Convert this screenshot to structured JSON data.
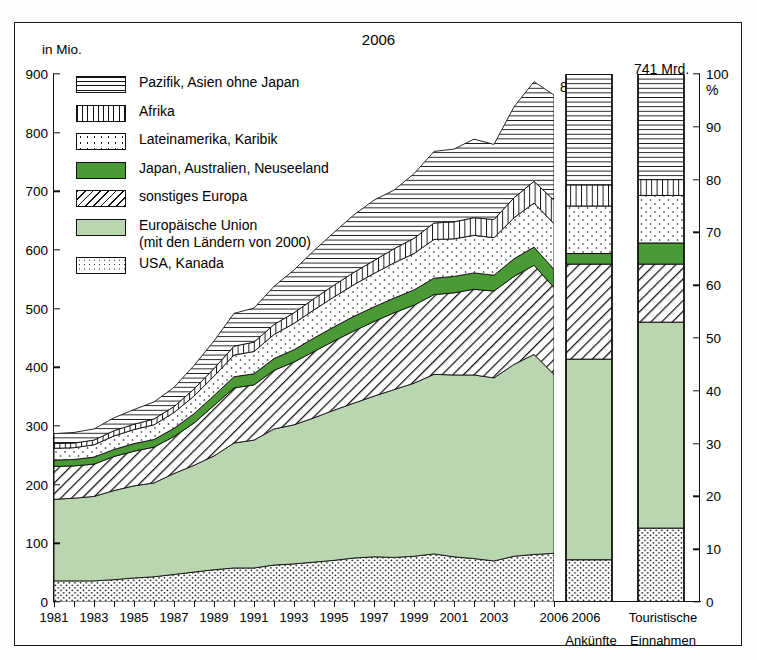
{
  "units": {
    "left_axis": "in Mio.",
    "right_axis": "%"
  },
  "header": {
    "year": "2006",
    "arrivals_value": "864 Mio.",
    "receipts_value_line1": "741 Mrd.",
    "receipts_value_line2": "US-$"
  },
  "colors": {
    "japan_green": "#4b9a36",
    "eu_green": "#bad6b1",
    "ink": "#111111",
    "paper": "#ffffff"
  },
  "legend": {
    "items": [
      {
        "label": "Pazifik, Asien ohne Japan",
        "sub": "",
        "pattern": "horizontal-lines",
        "key": "pazifik"
      },
      {
        "label": "Afrika",
        "sub": "",
        "pattern": "vertical-lines",
        "key": "afrika"
      },
      {
        "label": "Lateinamerika, Karibik",
        "sub": "",
        "pattern": "sparse-dots",
        "key": "latein"
      },
      {
        "label": "Japan, Australien, Neuseeland",
        "sub": "",
        "pattern": "solid-dark-green",
        "key": "japan"
      },
      {
        "label": "sonstiges Europa",
        "sub": "",
        "pattern": "diagonal-hatch",
        "key": "sonstiges"
      },
      {
        "label": "Europäische Union",
        "sub": "(mit den Ländern von 2000)",
        "pattern": "solid-light-green",
        "key": "eu"
      },
      {
        "label": "USA, Kanada",
        "sub": "",
        "pattern": "dense-dots",
        "key": "usa"
      }
    ]
  },
  "bottom_labels": {
    "year_2006": "2006",
    "group_title": "Touristische",
    "bar1": "Ankünfte",
    "bar2": "Einnahmen"
  },
  "chart_data": {
    "type": "area",
    "xlabel": "",
    "ylabel": "in Mio.",
    "ylim": [
      0,
      900
    ],
    "yticks": [
      0,
      100,
      200,
      300,
      400,
      500,
      600,
      700,
      800,
      900
    ],
    "right_ylim": [
      0,
      100
    ],
    "right_yticks": [
      0,
      10,
      20,
      30,
      40,
      50,
      60,
      70,
      80,
      90,
      100
    ],
    "grid": false,
    "legend_position": "upper-left-inside",
    "x": [
      1981,
      1982,
      1983,
      1984,
      1985,
      1986,
      1987,
      1988,
      1989,
      1990,
      1991,
      1992,
      1993,
      1994,
      1995,
      1996,
      1997,
      1998,
      1999,
      2000,
      2001,
      2002,
      2003,
      2004,
      2005,
      2006
    ],
    "xtick_labels": [
      "1981",
      "1983",
      "1985",
      "1987",
      "1989",
      "1991",
      "1993",
      "1995",
      "1997",
      "1999",
      "2001",
      "2003",
      "2006"
    ],
    "stack_order_bottom_to_top": [
      "USA, Kanada",
      "Europäische Union",
      "sonstiges Europa",
      "Japan, Australien, Neuseeland",
      "Lateinamerika, Karibik",
      "Afrika",
      "Pazifik, Asien ohne Japan"
    ],
    "series": [
      {
        "name": "USA, Kanada",
        "values": [
          36,
          36,
          36,
          38,
          41,
          43,
          47,
          51,
          55,
          58,
          58,
          63,
          65,
          68,
          71,
          75,
          77,
          76,
          78,
          82,
          77,
          74,
          70,
          78,
          81,
          83
        ]
      },
      {
        "name": "Europäische Union",
        "values": [
          139,
          141,
          144,
          152,
          157,
          160,
          172,
          182,
          194,
          213,
          218,
          232,
          237,
          246,
          256,
          264,
          274,
          286,
          295,
          306,
          310,
          313,
          312,
          327,
          341,
          305
        ]
      },
      {
        "name": "sonstiges Europa",
        "values": [
          56,
          55,
          55,
          58,
          59,
          61,
          63,
          72,
          86,
          94,
          94,
          100,
          107,
          113,
          118,
          123,
          127,
          131,
          133,
          136,
          140,
          146,
          148,
          150,
          152,
          148
        ]
      },
      {
        "name": "Japan, Australien, Neuseeland",
        "values": [
          11,
          11,
          12,
          12,
          13,
          13,
          14,
          16,
          17,
          19,
          19,
          20,
          21,
          23,
          24,
          25,
          25,
          25,
          26,
          28,
          28,
          28,
          27,
          30,
          31,
          31
        ]
      },
      {
        "name": "Lateinamerika, Karibik",
        "values": [
          20,
          20,
          21,
          23,
          24,
          25,
          27,
          30,
          33,
          37,
          38,
          41,
          45,
          48,
          51,
          54,
          57,
          60,
          62,
          66,
          64,
          64,
          64,
          70,
          75,
          78
        ]
      },
      {
        "name": "Afrika",
        "values": [
          8,
          8,
          8,
          9,
          9,
          10,
          10,
          12,
          13,
          15,
          16,
          17,
          18,
          19,
          20,
          21,
          22,
          24,
          26,
          28,
          29,
          30,
          31,
          34,
          37,
          40
        ]
      },
      {
        "name": "Pazifik, Asien ohne Japan",
        "values": [
          17,
          18,
          19,
          22,
          25,
          29,
          33,
          40,
          47,
          56,
          58,
          65,
          73,
          82,
          90,
          98,
          103,
          100,
          110,
          122,
          124,
          134,
          128,
          155,
          170,
          179
        ]
      }
    ],
    "totals": [
      287,
      289,
      295,
      314,
      328,
      341,
      366,
      403,
      445,
      492,
      501,
      538,
      566,
      599,
      630,
      660,
      685,
      702,
      730,
      768,
      772,
      789,
      780,
      844,
      887,
      864
    ],
    "bars": {
      "type": "stacked-bar-percent",
      "categories": [
        "Ankünfte",
        "Einnahmen"
      ],
      "unit": "%",
      "series": [
        {
          "name": "USA, Kanada",
          "values": [
            8,
            14
          ]
        },
        {
          "name": "Europäische Union",
          "values": [
            38,
            39
          ]
        },
        {
          "name": "sonstiges Europa",
          "values": [
            18,
            11
          ]
        },
        {
          "name": "Japan, Australien, Neuseeland",
          "values": [
            2,
            4
          ]
        },
        {
          "name": "Lateinamerika, Karibik",
          "values": [
            9,
            9
          ]
        },
        {
          "name": "Afrika",
          "values": [
            4,
            3
          ]
        },
        {
          "name": "Pazifik, Asien ohne Japan",
          "values": [
            21,
            20
          ]
        }
      ]
    }
  }
}
